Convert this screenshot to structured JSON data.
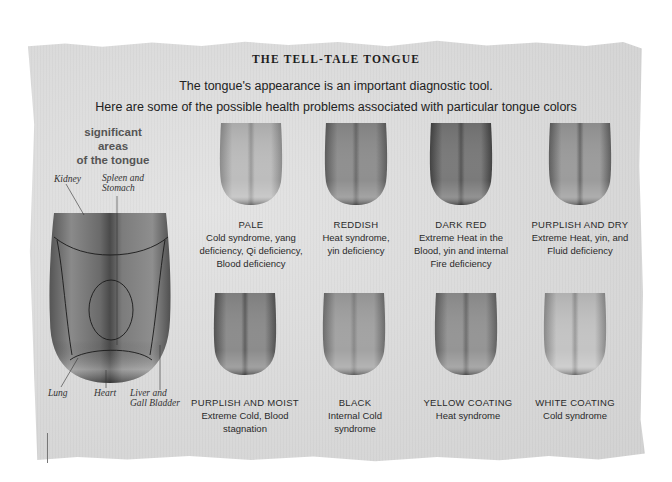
{
  "title": "THE TELL-TALE TONGUE",
  "subtitle": {
    "line1": "The tongue's appearance is an important diagnostic tool.",
    "line2": "Here are some of the possible health problems associated with particular tongue colors"
  },
  "diagram": {
    "heading_line1": "significant areas",
    "heading_line2": "of the tongue",
    "organs": {
      "kidney": "Kidney",
      "spleen_line1": "Spleen and",
      "spleen_line2": "Stomach",
      "lung": "Lung",
      "heart": "Heart",
      "liver_line1": "Liver and",
      "liver_line2": "Gall Bladder"
    }
  },
  "tongues": [
    {
      "name": "PALE",
      "desc_lines": [
        "Cold syndrome, yang",
        "deficiency, Qi deficiency,",
        "Blood deficiency"
      ],
      "base": "#bdbdbd",
      "dark": "#8a8a8a",
      "center": "#9a9a9a"
    },
    {
      "name": "REDDISH",
      "desc_lines": [
        "Heat syndrome,",
        "yin deficiency"
      ],
      "base": "#8f8f8f",
      "dark": "#5a5a5a",
      "center": "#6c6c6c"
    },
    {
      "name": "DARK RED",
      "desc_lines": [
        "Extreme Heat in the",
        "Blood, yin and internal",
        "Fire deficiency"
      ],
      "base": "#7a7a7a",
      "dark": "#3f3f3f",
      "center": "#555555"
    },
    {
      "name": "PURPLISH AND DRY",
      "desc_lines": [
        "Extreme Heat, yin, and",
        "Fluid deficiency"
      ],
      "base": "#9c9c9c",
      "dark": "#5c5c5c",
      "center": "#6a6a6a"
    },
    {
      "name": "PURPLISH AND MOIST",
      "desc_lines": [
        "Extreme Cold, Blood",
        "stagnation"
      ],
      "base": "#8c8c8c",
      "dark": "#4f4f4f",
      "center": "#5f5f5f"
    },
    {
      "name": "BLACK",
      "desc_lines": [
        "Internal Cold",
        "syndrome"
      ],
      "base": "#a3a3a3",
      "dark": "#6a6a6a",
      "center": "#888888"
    },
    {
      "name": "YELLOW COATING",
      "desc_lines": [
        "Heat syndrome"
      ],
      "base": "#959595",
      "dark": "#5e5e5e",
      "center": "#6e6e6e"
    },
    {
      "name": "WHITE COATING",
      "desc_lines": [
        "Cold syndrome"
      ],
      "base": "#c4c4c4",
      "dark": "#888888",
      "center": "#9a9a9a"
    }
  ]
}
